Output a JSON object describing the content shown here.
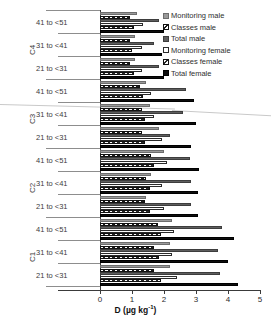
{
  "chart_data": {
    "type": "bar",
    "orientation": "horizontal",
    "title": "",
    "xlabel": "D (µg kg−1)",
    "ylabel": "",
    "xlim": [
      0,
      5
    ],
    "xticks": [
      0,
      1,
      2,
      3,
      4,
      5
    ],
    "grid": false,
    "legend_position": "top-right",
    "groups": [
      "C4",
      "C3",
      "C2",
      "C1"
    ],
    "categories": [
      "41 to <51",
      "31 to <41",
      "21 to <31"
    ],
    "series_names": [
      "Monitoring male",
      "Classes male",
      "Total male",
      "Monitoring female",
      "Classes female",
      "Total female"
    ],
    "clusters": [
      {
        "group": "C4",
        "category": "41 to <51",
        "values": [
          1.15,
          0.95,
          1.85,
          1.35,
          1.05,
          2.0
        ]
      },
      {
        "group": "C4",
        "category": "31 to <41",
        "values": [
          1.1,
          0.95,
          1.7,
          1.3,
          1.0,
          1.95
        ]
      },
      {
        "group": "C4",
        "category": "21 to <31",
        "values": [
          1.1,
          0.95,
          1.85,
          1.3,
          1.05,
          2.0
        ]
      },
      {
        "group": "C3",
        "category": "41 to <51",
        "values": [
          1.45,
          1.25,
          2.7,
          1.6,
          1.35,
          2.95
        ]
      },
      {
        "group": "C3",
        "category": "31 to <41",
        "values": [
          1.55,
          1.3,
          2.6,
          1.7,
          1.4,
          3.0
        ]
      },
      {
        "group": "C3",
        "category": "21 to <31",
        "values": [
          1.85,
          1.3,
          2.2,
          1.95,
          1.4,
          2.85
        ]
      },
      {
        "group": "C2",
        "category": "41 to <51",
        "values": [
          2.0,
          1.6,
          2.8,
          2.1,
          1.7,
          3.1
        ]
      },
      {
        "group": "C2",
        "category": "31 to <41",
        "values": [
          1.6,
          1.45,
          2.85,
          1.95,
          1.55,
          3.05
        ]
      },
      {
        "group": "C2",
        "category": "21 to <31",
        "values": [
          1.45,
          1.4,
          2.85,
          2.0,
          1.55,
          3.05
        ]
      },
      {
        "group": "C1",
        "category": "41 to <51",
        "values": [
          2.25,
          1.8,
          3.8,
          2.3,
          1.9,
          4.2
        ]
      },
      {
        "group": "C1",
        "category": "31 to <41",
        "values": [
          2.2,
          1.7,
          3.7,
          2.25,
          1.85,
          4.0
        ]
      },
      {
        "group": "C1",
        "category": "21 to <31",
        "values": [
          2.2,
          1.7,
          3.75,
          2.4,
          1.9,
          4.3
        ]
      }
    ]
  },
  "legend": {
    "items": [
      {
        "label": "Monitoring male",
        "swatch": "s-mon-m"
      },
      {
        "label": "Classes male",
        "swatch": "s-cls-m"
      },
      {
        "label": "Total male",
        "swatch": "s-tot-m"
      },
      {
        "label": "Monitoring  female",
        "swatch": "s-mon-f"
      },
      {
        "label": "Classes female",
        "swatch": "s-cls-f"
      },
      {
        "label": "Total female",
        "swatch": "s-tot-f"
      }
    ]
  },
  "axis": {
    "x_title_main": "D (µg kg",
    "x_title_sup": "-1",
    "x_title_tail": ")",
    "tick_labels": [
      "0",
      "1",
      "2",
      "3",
      "4",
      "5"
    ]
  }
}
